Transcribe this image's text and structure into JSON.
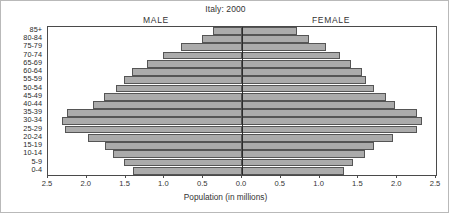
{
  "chart_data": {
    "type": "bar",
    "subtype": "population-pyramid",
    "title": "Italy: 2000",
    "xlabel": "Population (in millions)",
    "ylabel": "",
    "grid": false,
    "legend_position": "inside-top",
    "left_series_label": "MALE",
    "right_series_label": "FEMALE",
    "xlim": [
      -2.5,
      2.5
    ],
    "xticks_signed": [
      -2.5,
      -2.0,
      -1.5,
      -1.0,
      -0.5,
      0.0,
      0.5,
      1.0,
      1.5,
      2.0,
      2.5
    ],
    "xtick_labels": [
      "2.5",
      "2.0",
      "1.5",
      "1.0",
      "0.5",
      "0.0",
      "0.5",
      "1.0",
      "1.5",
      "2.0",
      "2.5"
    ],
    "categories": [
      "0-4",
      "5-9",
      "10-14",
      "15-19",
      "20-24",
      "25-29",
      "30-34",
      "35-39",
      "40-44",
      "45-49",
      "50-54",
      "55-59",
      "60-64",
      "65-69",
      "70-74",
      "75-79",
      "80-84",
      "85+"
    ],
    "categories_top_down": [
      "85+",
      "80-84",
      "75-79",
      "70-74",
      "65-69",
      "60-64",
      "55-59",
      "50-54",
      "45-49",
      "40-44",
      "35-39",
      "30-34",
      "25-29",
      "20-24",
      "15-19",
      "10-14",
      "5-9",
      "0-4"
    ],
    "series": [
      {
        "name": "MALE",
        "side": "left",
        "values_top_down": [
          0.38,
          0.52,
          0.79,
          1.02,
          1.22,
          1.42,
          1.52,
          1.62,
          1.78,
          1.92,
          2.25,
          2.32,
          2.28,
          1.98,
          1.76,
          1.66,
          1.52,
          1.4
        ]
      },
      {
        "name": "FEMALE",
        "side": "right",
        "values_top_down": [
          0.71,
          0.86,
          1.08,
          1.26,
          1.4,
          1.54,
          1.6,
          1.7,
          1.85,
          1.97,
          2.26,
          2.32,
          2.26,
          1.94,
          1.7,
          1.58,
          1.43,
          1.32
        ]
      }
    ],
    "colors": {
      "bar_fill": "#ababab",
      "bar_edge": "#555555",
      "axis": "#4a4a4a",
      "center_axis": "#2b2b2b",
      "text": "#333333",
      "background": "#ffffff",
      "frame": "#b9b9b9"
    }
  }
}
